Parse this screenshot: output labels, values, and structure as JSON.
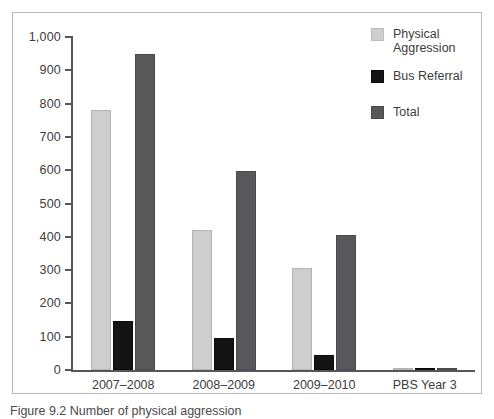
{
  "figure": {
    "caption": "Figure 9.2 Number of physical aggression"
  },
  "legend": {
    "position": "top-right",
    "entries": [
      {
        "label": "Physical\nAggression",
        "color": "#cecece",
        "icon": "legend-swatch"
      },
      {
        "label": "Bus Referral",
        "color": "#141414",
        "icon": "legend-swatch"
      },
      {
        "label": "Total",
        "color": "#58585a",
        "icon": "legend-swatch"
      }
    ]
  },
  "axes": {
    "y_ticks": [
      "1,000",
      "900",
      "800",
      "700",
      "600",
      "500",
      "400",
      "300",
      "200",
      "100",
      "0"
    ],
    "x_labels": [
      "2007–2008",
      "2008–2009",
      "2009–2010",
      "PBS Year 3"
    ]
  },
  "colors": {
    "physical_aggression": "#cecece",
    "bus_referral": "#141414",
    "total": "#58585a",
    "axis": "#55565a",
    "frame": "#b8b8b8",
    "text": "#3c3c3c"
  },
  "chart_data": {
    "type": "bar",
    "title": "",
    "subtitle": "",
    "xlabel": "",
    "ylabel": "",
    "ylim": [
      0,
      1000
    ],
    "ytick_step": 100,
    "grid": false,
    "legend_position": "top-right",
    "categories": [
      "2007–2008",
      "2008–2009",
      "2009–2010",
      "PBS Year 3"
    ],
    "series": [
      {
        "name": "Physical Aggression",
        "color": "#cecece",
        "values": [
          780,
          420,
          305,
          3
        ]
      },
      {
        "name": "Bus Referral",
        "color": "#141414",
        "values": [
          148,
          97,
          44,
          2
        ]
      },
      {
        "name": "Total",
        "color": "#58585a",
        "values": [
          948,
          597,
          405,
          5
        ]
      }
    ]
  }
}
